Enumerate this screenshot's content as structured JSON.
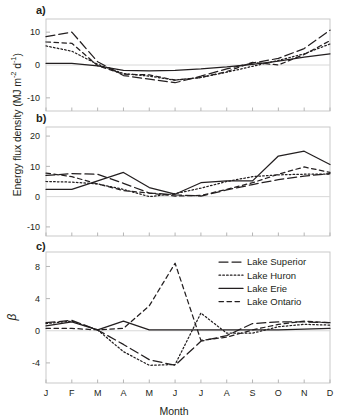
{
  "figure": {
    "ylabel_main": "Energy flux density (MJ m",
    "ylabel_main_sup1": "-2",
    "ylabel_main_mid": " d",
    "ylabel_main_sup2": "-1",
    "ylabel_main_end": ")",
    "ylabel_beta": "β",
    "xlabel": "Month",
    "panel_a_letter": "a)",
    "panel_b_letter": "b)",
    "panel_c_letter": "c)"
  },
  "legend": {
    "position": "panel-c-top-right",
    "entries": [
      {
        "label": "Lake Superior",
        "style": "long-dash",
        "dasharray": "9,4"
      },
      {
        "label": "Lake Huron",
        "style": "dotted",
        "dasharray": "1.6,2.2"
      },
      {
        "label": "Lake Erie",
        "style": "solid",
        "dasharray": "none"
      },
      {
        "label": "Lake Ontario",
        "style": "short-dash",
        "dasharray": "4.5,3.5"
      }
    ]
  },
  "colors": {
    "line": "#231f20",
    "frame": "#c9c9c9",
    "zero": "#d8d8d8",
    "background": "#ffffff"
  },
  "chart_data": [
    {
      "panel": "a)",
      "type": "line",
      "title": "",
      "xlabel": "",
      "ylabel": "Energy flux density (MJ m-2 d-1)",
      "categories": [
        "J",
        "F",
        "M",
        "A",
        "M",
        "J",
        "J",
        "A",
        "S",
        "O",
        "N",
        "D"
      ],
      "ylim": [
        -14,
        14
      ],
      "yticks": [
        10,
        0,
        -10
      ],
      "grid": false,
      "series": [
        {
          "name": "Lake Superior",
          "values": [
            8.6,
            10.0,
            1.0,
            -3.2,
            -4.3,
            -5.4,
            -3.4,
            -1.2,
            0.6,
            2.0,
            5.0,
            10.6
          ]
        },
        {
          "name": "Lake Huron",
          "values": [
            5.8,
            4.2,
            0.2,
            -2.6,
            -3.4,
            -4.6,
            -3.8,
            -2.2,
            -0.4,
            1.4,
            3.4,
            6.4
          ]
        },
        {
          "name": "Lake Erie",
          "values": [
            0.5,
            0.5,
            -0.3,
            -1.6,
            -1.8,
            -1.6,
            -1.2,
            -0.6,
            0.2,
            1.2,
            2.4,
            3.4
          ]
        },
        {
          "name": "Lake Ontario",
          "values": [
            7.0,
            6.6,
            -0.2,
            -2.8,
            -3.0,
            -4.6,
            -3.8,
            -2.0,
            0.8,
            0.0,
            3.2,
            7.4
          ]
        }
      ]
    },
    {
      "panel": "b)",
      "type": "line",
      "title": "",
      "xlabel": "",
      "ylabel": "Energy flux density (MJ m-2 d-1)",
      "categories": [
        "J",
        "F",
        "M",
        "A",
        "M",
        "J",
        "J",
        "A",
        "S",
        "O",
        "N",
        "D"
      ],
      "ylim": [
        -13,
        23
      ],
      "yticks": [
        20,
        10,
        0,
        -10
      ],
      "grid": false,
      "series": [
        {
          "name": "Lake Superior",
          "values": [
            7.0,
            7.6,
            7.4,
            4.4,
            1.2,
            0.6,
            0.2,
            2.2,
            4.0,
            5.6,
            6.8,
            7.6
          ]
        },
        {
          "name": "Lake Huron",
          "values": [
            5.0,
            4.8,
            4.2,
            2.4,
            0.0,
            1.0,
            2.8,
            5.0,
            6.6,
            7.2,
            7.4,
            7.4
          ]
        },
        {
          "name": "Lake Erie",
          "values": [
            2.4,
            2.4,
            5.2,
            8.0,
            3.0,
            0.8,
            4.6,
            5.2,
            5.2,
            13.4,
            15.0,
            10.6
          ]
        },
        {
          "name": "Lake Ontario",
          "values": [
            7.8,
            6.6,
            4.2,
            2.0,
            1.2,
            0.2,
            0.4,
            2.4,
            4.6,
            7.4,
            9.8,
            8.0
          ]
        }
      ]
    },
    {
      "panel": "c)",
      "type": "line",
      "title": "",
      "xlabel": "Month",
      "ylabel": "β",
      "categories": [
        "J",
        "F",
        "M",
        "A",
        "M",
        "J",
        "J",
        "A",
        "S",
        "O",
        "N",
        "D"
      ],
      "ylim": [
        -6.5,
        9.8
      ],
      "yticks": [
        8,
        4,
        0,
        -4
      ],
      "grid": false,
      "series": [
        {
          "name": "Lake Superior",
          "values": [
            1.0,
            1.3,
            0.1,
            -1.7,
            -3.6,
            -4.3,
            -1.3,
            -0.6,
            0.9,
            1.1,
            1.1,
            1.0
          ]
        },
        {
          "name": "Lake Huron",
          "values": [
            0.9,
            1.2,
            0.1,
            -2.6,
            -4.3,
            -4.2,
            2.2,
            -0.3,
            -0.3,
            0.5,
            0.8,
            0.7
          ]
        },
        {
          "name": "Lake Erie",
          "values": [
            0.6,
            1.1,
            0.1,
            1.2,
            0.1,
            0.1,
            0.1,
            0.1,
            0.1,
            0.1,
            0.2,
            0.3
          ]
        },
        {
          "name": "Lake Ontario",
          "values": [
            0.3,
            0.3,
            0.1,
            0.3,
            3.1,
            8.4,
            -1.2,
            -0.8,
            0.1,
            0.8,
            1.2,
            1.0
          ]
        }
      ]
    }
  ]
}
